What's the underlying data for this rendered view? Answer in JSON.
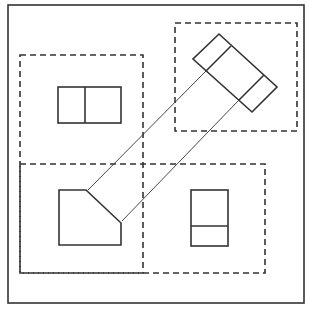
{
  "diagram": {
    "type": "orthographic-projection",
    "colors": {
      "stroke": "#333333",
      "background": "#ffffff"
    },
    "frame": {
      "x": 8,
      "y": 5,
      "w": 296,
      "h": 298
    },
    "dashed_regions": [
      {
        "name": "front-view-region",
        "x": 20,
        "y": 55,
        "w": 123,
        "h": 218
      },
      {
        "name": "auxiliary-view-region",
        "x": 175,
        "y": 23,
        "w": 122,
        "h": 108
      },
      {
        "name": "bottom-views-region",
        "x": 20,
        "y": 164,
        "w": 245,
        "h": 109
      }
    ],
    "views": {
      "front": {
        "rect": {
          "x": 58,
          "y": 87,
          "w": 63,
          "h": 36
        },
        "divider_x": 85
      },
      "top": {
        "points": "59,190 86,190 121,223 121,245 59,245"
      },
      "side": {
        "rect": {
          "x": 191,
          "y": 190,
          "w": 37,
          "h": 56
        },
        "divider_y": 226
      },
      "auxiliary": {
        "points": "219,34 277,87 252,112 193,59",
        "dividers": [
          {
            "x1": 231,
            "y1": 46,
            "x2": 206,
            "y2": 71
          },
          {
            "x1": 264,
            "y1": 75,
            "x2": 239,
            "y2": 100
          }
        ]
      }
    },
    "projection_lines": [
      {
        "x1": 206,
        "y1": 71,
        "x2": 88,
        "y2": 190
      },
      {
        "x1": 239,
        "y1": 100,
        "x2": 122,
        "y2": 221
      }
    ]
  }
}
